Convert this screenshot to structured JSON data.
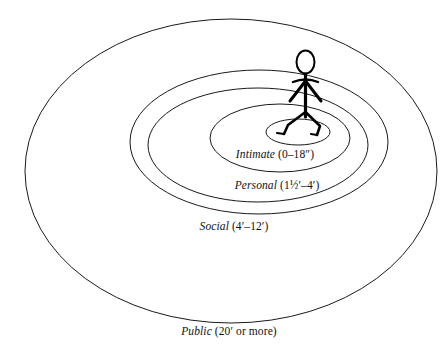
{
  "diagram": {
    "background_color": "#ffffff",
    "line_color": "#1a1a1a",
    "figure": {
      "icon_name": "stick-figure-person",
      "description": "Stick figure person standing at the center of the zones"
    },
    "zones": [
      {
        "id": "intimate",
        "name": "Intimate",
        "range": "(0–18″)",
        "label": "Intimate (0–18″)",
        "order": 1
      },
      {
        "id": "personal",
        "name": "Personal",
        "range": "(1½′–4′)",
        "label": "Personal (1½′–4′)",
        "order": 2
      },
      {
        "id": "social",
        "name": "Social",
        "range": "(4′–12′)",
        "label": "Social (4′–12′)",
        "order": 3
      },
      {
        "id": "public",
        "name": "Public",
        "range": "(20′ or more)",
        "label": "Public (20′ or more)",
        "order": 4
      }
    ]
  }
}
